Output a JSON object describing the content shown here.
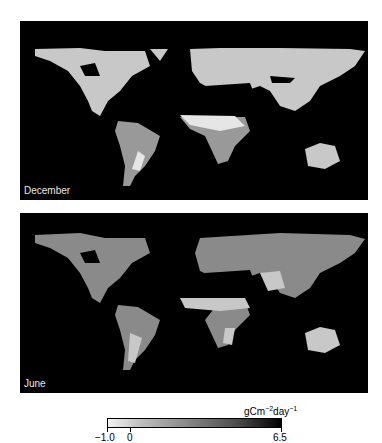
{
  "panels": [
    {
      "label": "December"
    },
    {
      "label": "June"
    }
  ],
  "colorbar": {
    "unit_base": "gCm",
    "unit_exp1": "−2",
    "unit_mid": "day",
    "unit_exp2": "−1",
    "ticks": [
      "−1.0",
      "0",
      "6.5"
    ],
    "range": [
      -1.0,
      6.5
    ],
    "colors": {
      "low": "#f2f2f2",
      "high": "#000000"
    }
  }
}
